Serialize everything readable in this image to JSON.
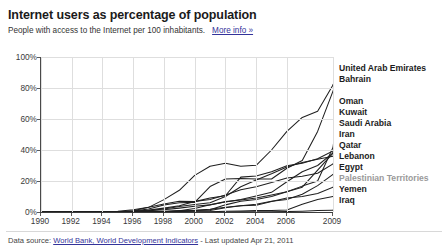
{
  "header": {
    "title": "Internet users as percentage of population",
    "subtitle": "People with access to the Internet per 100 inhabitants.",
    "more_info_label": "More info »"
  },
  "footer": {
    "prefix": "Data source:",
    "source_link": "World Bank, World Development Indicators",
    "suffix": "- Last updated Apr 21, 2011"
  },
  "colors": {
    "line": "#1f1f1f",
    "grid": "#dedede",
    "axis": "#3c3c3c",
    "link": "#33339a",
    "muted_label": "#9a9a9a"
  },
  "chart_data": {
    "type": "line",
    "title": "Internet users as percentage of population",
    "subtitle": "People with access to the Internet per 100 inhabitants.",
    "xlabel": "",
    "ylabel": "",
    "xlim": [
      1990,
      2009
    ],
    "ylim": [
      0,
      100
    ],
    "grid": true,
    "legend_position": "right",
    "ytick_labels": [
      "0%",
      "20%",
      "40%",
      "60%",
      "80%",
      "100%"
    ],
    "ytick_values": [
      0,
      20,
      40,
      60,
      80,
      100
    ],
    "xtick_labels": [
      "1990",
      "1992",
      "1994",
      "1996",
      "1998",
      "2000",
      "2002",
      "2004",
      "2006",
      "2009"
    ],
    "xtick_values": [
      1990,
      1992,
      1994,
      1996,
      1998,
      2000,
      2002,
      2004,
      2006,
      2009
    ],
    "x": [
      1990,
      1991,
      1992,
      1993,
      1994,
      1995,
      1996,
      1997,
      1998,
      1999,
      2000,
      2001,
      2002,
      2003,
      2004,
      2005,
      2006,
      2007,
      2008,
      2009
    ],
    "series": [
      {
        "name": "United Arab Emirates",
        "values": [
          0,
          0,
          0,
          0,
          0.1,
          0.2,
          0.8,
          3.0,
          8.0,
          14.0,
          23.6,
          29.5,
          31.5,
          29.5,
          30.1,
          40.0,
          52.0,
          61.0,
          65.0,
          82.0
        ]
      },
      {
        "name": "Bahrain",
        "values": [
          0,
          0,
          0,
          0,
          0.1,
          0.2,
          0.6,
          2.0,
          4.5,
          6.0,
          6.2,
          16.4,
          21.3,
          21.6,
          21.3,
          21.3,
          28.2,
          33.2,
          52.0,
          78.0
        ]
      },
      {
        "name": "Oman",
        "values": [
          0,
          0,
          0,
          0,
          0,
          0.1,
          0.3,
          0.8,
          1.4,
          2.5,
          3.7,
          4.6,
          6.7,
          7.8,
          9.1,
          11.0,
          13.0,
          16.7,
          20.0,
          41.7
        ]
      },
      {
        "name": "Kuwait",
        "values": [
          0,
          0,
          0,
          0.1,
          0.2,
          0.5,
          1.4,
          3.0,
          5.2,
          7.0,
          6.7,
          9.0,
          10.5,
          22.5,
          23.2,
          25.9,
          29.8,
          31.5,
          34.3,
          39.4
        ]
      },
      {
        "name": "Saudi Arabia",
        "values": [
          0,
          0,
          0,
          0,
          0,
          0.0,
          0.0,
          0.1,
          0.2,
          0.8,
          2.2,
          4.7,
          6.4,
          8.0,
          10.3,
          12.7,
          19.5,
          26.0,
          30.0,
          38.1
        ]
      },
      {
        "name": "Iran",
        "values": [
          0,
          0,
          0,
          0,
          0,
          0.0,
          0.0,
          0.1,
          0.2,
          0.3,
          0.9,
          1.5,
          4.6,
          6.9,
          8.1,
          10.0,
          13.0,
          16.0,
          27.0,
          38.0
        ]
      },
      {
        "name": "Qatar",
        "values": [
          0,
          0,
          0,
          0,
          0,
          0.1,
          0.3,
          1.0,
          2.0,
          3.5,
          4.9,
          6.0,
          10.0,
          16.3,
          20.7,
          24.7,
          29.0,
          32.0,
          34.0,
          36.0
        ]
      },
      {
        "name": "Lebanon",
        "values": [
          0,
          0,
          0,
          0,
          0.1,
          0.2,
          0.5,
          1.2,
          2.5,
          4.0,
          6.8,
          8.0,
          11.0,
          14.3,
          16.3,
          19.0,
          22.0,
          23.0,
          25.0,
          31.0
        ]
      },
      {
        "name": "Egypt",
        "values": [
          0,
          0,
          0,
          0,
          0,
          0.0,
          0.0,
          0.1,
          0.2,
          0.4,
          0.8,
          1.0,
          2.7,
          4.0,
          5.0,
          6.9,
          8.0,
          11.5,
          17.0,
          24.3
        ]
      },
      {
        "name": "Palestinian Territories",
        "values": [
          0,
          0,
          0,
          0,
          0,
          0,
          0.1,
          0.2,
          0.5,
          1.0,
          1.1,
          1.8,
          3.1,
          4.0,
          4.4,
          6.8,
          9.0,
          10.0,
          12.0,
          16.0
        ]
      },
      {
        "name": "Yemen",
        "values": [
          0,
          0,
          0,
          0,
          0,
          0,
          0.0,
          0.0,
          0.0,
          0.1,
          0.1,
          0.1,
          0.5,
          0.6,
          0.9,
          1.0,
          1.3,
          5.0,
          8.0,
          10.0
        ]
      },
      {
        "name": "Iraq",
        "values": [
          0,
          0,
          0,
          0,
          0,
          0,
          0,
          0,
          0,
          0,
          0.0,
          0.0,
          0.0,
          0.1,
          0.1,
          0.2,
          0.3,
          0.5,
          0.9,
          1.1
        ]
      }
    ]
  },
  "legend": {
    "entries": [
      {
        "label": "United Arab Emirates",
        "muted": false,
        "y": 0
      },
      {
        "label": "Bahrain",
        "muted": false,
        "y": 11
      },
      {
        "label": "Oman",
        "muted": false,
        "y": 33
      },
      {
        "label": "Kuwait",
        "muted": false,
        "y": 44
      },
      {
        "label": "Saudi Arabia",
        "muted": false,
        "y": 55
      },
      {
        "label": "Iran",
        "muted": false,
        "y": 66
      },
      {
        "label": "Qatar",
        "muted": false,
        "y": 77
      },
      {
        "label": "Lebanon",
        "muted": false,
        "y": 88
      },
      {
        "label": "Egypt",
        "muted": false,
        "y": 99
      },
      {
        "label": "Palestinian Territories",
        "muted": true,
        "y": 110
      },
      {
        "label": "Yemen",
        "muted": false,
        "y": 121
      },
      {
        "label": "Iraq",
        "muted": false,
        "y": 132
      }
    ]
  }
}
